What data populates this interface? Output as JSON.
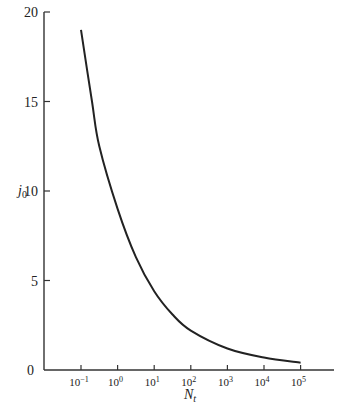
{
  "chart_data": {
    "type": "line",
    "title": "",
    "xlabel": "N_t",
    "xlabel_main": "N",
    "xlabel_sub": "t",
    "ylabel": "j_0",
    "ylabel_main": "j",
    "ylabel_sub": "0",
    "x_scale": "log",
    "xlim_log10": [
      -2,
      6
    ],
    "ylim": [
      0,
      20
    ],
    "grid": false,
    "x_ticks": [
      {
        "log10": -1,
        "base": "10",
        "exp": "−1"
      },
      {
        "log10": 0,
        "base": "10",
        "exp": "0"
      },
      {
        "log10": 1,
        "base": "10",
        "exp": "1"
      },
      {
        "log10": 2,
        "base": "10",
        "exp": "2"
      },
      {
        "log10": 3,
        "base": "10",
        "exp": "3"
      },
      {
        "log10": 4,
        "base": "10",
        "exp": "4"
      },
      {
        "log10": 5,
        "base": "10",
        "exp": "5"
      }
    ],
    "y_ticks": [
      0,
      5,
      10,
      15,
      20
    ],
    "series": [
      {
        "name": "j0 vs Nt",
        "color": "#222222",
        "log10_x": [
          -1,
          -0.7,
          -0.5,
          0,
          0.5,
          1,
          1.5,
          2,
          3,
          4,
          5
        ],
        "y": [
          19,
          15,
          12.5,
          9,
          6.3,
          4.4,
          3.1,
          2.2,
          1.2,
          0.7,
          0.4
        ]
      }
    ]
  }
}
